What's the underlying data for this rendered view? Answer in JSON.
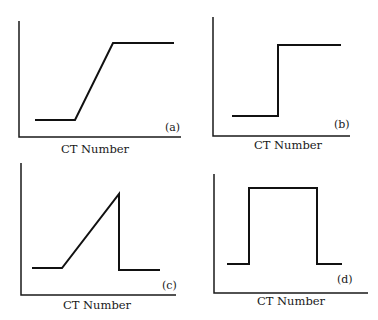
{
  "figure": {
    "panels": [
      {
        "id": "a",
        "label": "(a)",
        "xlabel": "CT Number",
        "shape": "ramp-up",
        "axis": {
          "x0": 19,
          "y_top": 21,
          "y0": 137,
          "x_end": 181
        },
        "points": [
          [
            35,
            120
          ],
          [
            75,
            120
          ],
          [
            113,
            43
          ],
          [
            174,
            43
          ]
        ],
        "label_pos": [
          165,
          131
        ],
        "xlabel_pos": [
          95,
          153
        ]
      },
      {
        "id": "b",
        "label": "(b)",
        "xlabel": "CT Number",
        "shape": "step-up",
        "axis": {
          "x0": 213,
          "y_top": 17,
          "y0": 136,
          "x_end": 350
        },
        "points": [
          [
            232,
            116
          ],
          [
            278,
            116
          ],
          [
            278,
            45
          ],
          [
            341,
            45
          ]
        ],
        "label_pos": [
          334,
          128
        ],
        "xlabel_pos": [
          288,
          149
        ]
      },
      {
        "id": "c",
        "label": "(c)",
        "xlabel": "CT Number",
        "shape": "ramp-up-then-drop",
        "axis": {
          "x0": 21,
          "y_top": 163,
          "y0": 295,
          "x_end": 176
        },
        "points": [
          [
            32,
            268
          ],
          [
            62,
            268
          ],
          [
            119,
            194
          ],
          [
            119,
            270
          ],
          [
            160,
            270
          ]
        ],
        "label_pos": [
          162,
          289
        ],
        "xlabel_pos": [
          97,
          309
        ]
      },
      {
        "id": "d",
        "label": "(d)",
        "xlabel": "CT Number",
        "shape": "rectangular-pulse",
        "axis": {
          "x0": 214,
          "y_top": 174,
          "y0": 293,
          "x_end": 368
        },
        "points": [
          [
            227,
            264
          ],
          [
            249,
            264
          ],
          [
            249,
            188
          ],
          [
            317,
            188
          ],
          [
            317,
            264
          ],
          [
            342,
            264
          ]
        ],
        "label_pos": [
          337,
          283
        ],
        "xlabel_pos": [
          291,
          305
        ]
      }
    ]
  },
  "colors": {
    "ink": "#111111",
    "background": "#ffffff"
  }
}
